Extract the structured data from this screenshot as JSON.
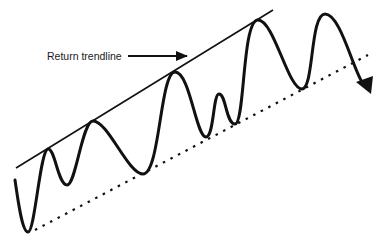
{
  "diagram": {
    "type": "trend-channel",
    "annotations": [
      {
        "id": "return-trendline",
        "text": "Return trendline"
      }
    ],
    "elements": {
      "return_trendline": {
        "style": "solid"
      },
      "support_trendline": {
        "style": "dotted"
      },
      "price_path": {
        "style": "solid-wave",
        "ends_with": "arrowhead-down"
      }
    },
    "colors": {
      "ink": "#111111",
      "background": "#ffffff"
    }
  }
}
